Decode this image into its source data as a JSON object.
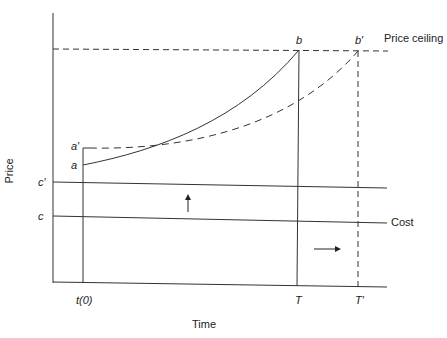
{
  "diagram": {
    "axes": {
      "x_label": "Time",
      "y_label": "Price"
    },
    "lines": {
      "price_ceiling": "Price ceiling",
      "cost": "Cost"
    },
    "point_labels": {
      "a": "a",
      "a_prime": "a′",
      "b": "b",
      "b_prime": "b′",
      "c": "c",
      "c_prime": "c′"
    },
    "time_labels": {
      "t0": "t(0)",
      "T": "T",
      "T_prime": "T′"
    },
    "arrows": [
      {
        "name": "cost-increase-arrow",
        "direction": "up"
      },
      {
        "name": "time-extension-arrow",
        "direction": "right"
      }
    ],
    "colors": {
      "line": "#333333",
      "background": "#ffffff"
    }
  }
}
